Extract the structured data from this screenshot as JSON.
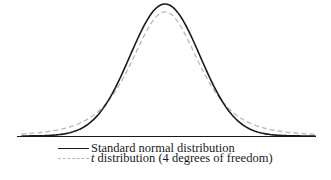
{
  "chart_data": {
    "type": "line",
    "title": "",
    "xlabel": "",
    "ylabel": "",
    "x_range": [
      -4,
      4
    ],
    "grid": false,
    "axes": {
      "baseline_only": true,
      "ticks": false
    },
    "legend_position": "bottom",
    "series": [
      {
        "name": "Standard normal distribution",
        "style": "solid",
        "color": "#1a1a1a",
        "x": [
          -4,
          -3.5,
          -3,
          -2.5,
          -2,
          -1.5,
          -1,
          -0.5,
          0,
          0.5,
          1,
          1.5,
          2,
          2.5,
          3,
          3.5,
          4
        ],
        "values": [
          0.0001,
          0.0009,
          0.0044,
          0.0175,
          0.054,
          0.1295,
          0.242,
          0.3521,
          0.3989,
          0.3521,
          0.242,
          0.1295,
          0.054,
          0.0175,
          0.0044,
          0.0009,
          0.0001
        ]
      },
      {
        "name": "t distribution (4 degrees of freedom)",
        "style": "dashed",
        "color": "#b8b8b8",
        "x": [
          -4,
          -3.5,
          -3,
          -2.5,
          -2,
          -1.5,
          -1,
          -0.5,
          0,
          0.5,
          1,
          1.5,
          2,
          2.5,
          3,
          3.5,
          4
        ],
        "values": [
          0.0067,
          0.0109,
          0.0197,
          0.0364,
          0.0663,
          0.1134,
          0.2147,
          0.3216,
          0.375,
          0.3216,
          0.2147,
          0.1134,
          0.0663,
          0.0364,
          0.0197,
          0.0109,
          0.0067
        ]
      }
    ]
  },
  "legend": {
    "items": [
      {
        "label_prefix": "",
        "label": "Standard normal distribution",
        "style": "solid"
      },
      {
        "label_prefix": "t",
        "label": " distribution (4 degrees of freedom)",
        "style": "dashed"
      }
    ]
  },
  "colors": {
    "normal_curve": "#1a1a1a",
    "t_curve": "#b8b8b8",
    "baseline": "#1a1a1a"
  }
}
